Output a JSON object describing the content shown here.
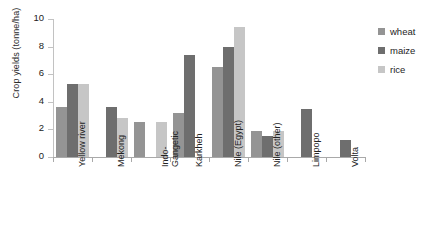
{
  "chart_data": {
    "type": "bar",
    "title": "",
    "xlabel": "",
    "ylabel": "Crop yields (tonne/ha)",
    "ylim": [
      0,
      10
    ],
    "yticks": [
      0,
      2,
      4,
      6,
      8,
      10
    ],
    "ytick_labels": [
      "0",
      "2",
      "4",
      "6",
      "8",
      "10"
    ],
    "grid": false,
    "legend_position": "right",
    "categories": [
      "Yellow river",
      "Mekong",
      "Indo-Gangetic",
      "Karkheh",
      "Nile (Egypt)",
      "Nile (other)",
      "Limpopo",
      "Volta"
    ],
    "category_lines": [
      [
        "Yellow river"
      ],
      [
        "Mekong"
      ],
      [
        "Indo-",
        "Gangetic"
      ],
      [
        "Karkheh"
      ],
      [
        "Nile (Egypt)"
      ],
      [
        "Nile (other)"
      ],
      [
        "Limpopo"
      ],
      [
        "Volta"
      ]
    ],
    "series": [
      {
        "name": "wheat",
        "color": "#949494",
        "values": [
          3.6,
          null,
          2.55,
          3.2,
          6.5,
          1.9,
          null,
          null
        ]
      },
      {
        "name": "maize",
        "color": "#6e6e6e",
        "values": [
          5.3,
          3.6,
          null,
          7.4,
          8.0,
          1.55,
          3.5,
          1.2
        ]
      },
      {
        "name": "rice",
        "color": "#c6c6c6",
        "values": [
          5.3,
          2.8,
          2.55,
          null,
          9.4,
          1.9,
          null,
          null
        ]
      }
    ]
  },
  "legend": {
    "items": [
      {
        "label": "wheat",
        "color": "#949494"
      },
      {
        "label": "maize",
        "color": "#6e6e6e"
      },
      {
        "label": "rice",
        "color": "#c6c6c6"
      }
    ]
  }
}
